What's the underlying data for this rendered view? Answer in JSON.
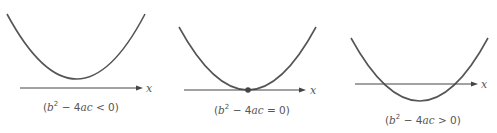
{
  "diagram": {
    "axis_label": "x",
    "colors": {
      "curve": "#555555",
      "axis": "#444444",
      "background": "#ffffff"
    },
    "panels": [
      {
        "id": "negative",
        "caption": {
          "open": "(",
          "b": "b",
          "exp": "2",
          "rest": " − 4",
          "ac": "ac",
          "rel": " < 0)"
        },
        "relation": "<",
        "roots": 0,
        "note": "Parabola lies entirely above the x-axis"
      },
      {
        "id": "zero",
        "caption": {
          "open": "(",
          "b": "b",
          "exp": "2",
          "rest": " − 4",
          "ac": "ac",
          "rel": " = 0)"
        },
        "relation": "=",
        "roots": 1,
        "note": "Parabola touches the x-axis at one point (marked dot)"
      },
      {
        "id": "positive",
        "caption": {
          "open": "(",
          "b": "b",
          "exp": "2",
          "rest": " − 4",
          "ac": "ac",
          "rel": " > 0)"
        },
        "relation": ">",
        "roots": 2,
        "note": "Parabola crosses the x-axis at two points"
      }
    ]
  }
}
